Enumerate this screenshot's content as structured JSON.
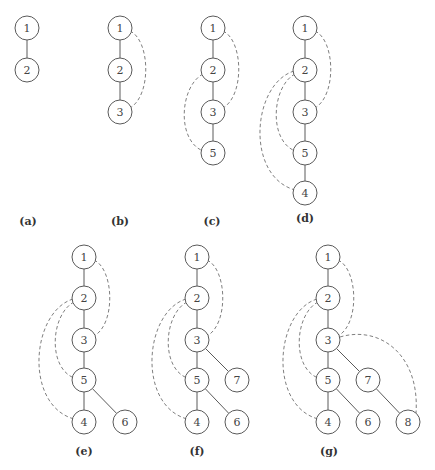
{
  "figure": {
    "style": {
      "node_stroke": "#5a5a5a",
      "edge_color": "#5a5a5a",
      "dashed_color": "#707070",
      "text_color": "#444444"
    },
    "panels": [
      {
        "caption": "(a)",
        "caption_pos": [
          28,
          225
        ],
        "nodes": [
          {
            "id": "1",
            "x": 27,
            "y": 28
          },
          {
            "id": "2",
            "x": 27,
            "y": 70
          }
        ],
        "tree_edges": [
          [
            "1",
            "2"
          ]
        ],
        "back_edges": []
      },
      {
        "caption": "(b)",
        "caption_pos": [
          120,
          225
        ],
        "nodes": [
          {
            "id": "1",
            "x": 120,
            "y": 28
          },
          {
            "id": "2",
            "x": 120,
            "y": 70
          },
          {
            "id": "3",
            "x": 120,
            "y": 112
          }
        ],
        "tree_edges": [
          [
            "1",
            "2"
          ],
          [
            "2",
            "3"
          ]
        ],
        "back_edges": [
          {
            "from": "1",
            "to": "3",
            "path": "M130,31 C150,40 152,95 130,108"
          }
        ]
      },
      {
        "caption": "(c)",
        "caption_pos": [
          212,
          225
        ],
        "nodes": [
          {
            "id": "1",
            "x": 213,
            "y": 28
          },
          {
            "id": "2",
            "x": 213,
            "y": 70
          },
          {
            "id": "3",
            "x": 213,
            "y": 112
          },
          {
            "id": "5",
            "x": 213,
            "y": 153
          }
        ],
        "tree_edges": [
          [
            "1",
            "2"
          ],
          [
            "2",
            "3"
          ],
          [
            "3",
            "5"
          ]
        ],
        "back_edges": [
          {
            "from": "1",
            "to": "3",
            "path": "M223,31 C243,40 245,95 223,108"
          },
          {
            "from": "2",
            "to": "5",
            "path": "M203,74 C180,86 176,140 203,151"
          }
        ]
      },
      {
        "caption": "(d)",
        "caption_pos": [
          305,
          222
        ],
        "nodes": [
          {
            "id": "1",
            "x": 305,
            "y": 28
          },
          {
            "id": "2",
            "x": 305,
            "y": 70
          },
          {
            "id": "3",
            "x": 305,
            "y": 112
          },
          {
            "id": "5",
            "x": 305,
            "y": 153
          },
          {
            "id": "4",
            "x": 305,
            "y": 193
          }
        ],
        "tree_edges": [
          [
            "1",
            "2"
          ],
          [
            "2",
            "3"
          ],
          [
            "3",
            "5"
          ],
          [
            "5",
            "4"
          ]
        ],
        "back_edges": [
          {
            "from": "1",
            "to": "3",
            "path": "M315,31 C335,40 337,95 315,108"
          },
          {
            "from": "2",
            "to": "5",
            "path": "M295,74 C272,86 268,140 295,151"
          },
          {
            "from": "2",
            "to": "4",
            "path": "M294,71 C252,84 245,176 295,190"
          }
        ]
      },
      {
        "caption": "(e)",
        "caption_pos": [
          84,
          455
        ],
        "nodes": [
          {
            "id": "1",
            "x": 84,
            "y": 257
          },
          {
            "id": "2",
            "x": 84,
            "y": 298
          },
          {
            "id": "3",
            "x": 84,
            "y": 340
          },
          {
            "id": "5",
            "x": 84,
            "y": 380
          },
          {
            "id": "4",
            "x": 84,
            "y": 422
          },
          {
            "id": "6",
            "x": 125,
            "y": 422
          }
        ],
        "tree_edges": [
          [
            "1",
            "2"
          ],
          [
            "2",
            "3"
          ],
          [
            "3",
            "5"
          ],
          [
            "5",
            "4"
          ],
          [
            "5",
            "6"
          ]
        ],
        "back_edges": [
          {
            "from": "1",
            "to": "3",
            "path": "M94,260 C114,269 116,324 94,336"
          },
          {
            "from": "2",
            "to": "5",
            "path": "M74,302 C51,314 47,367 74,378"
          },
          {
            "from": "2",
            "to": "4",
            "path": "M73,299 C31,312 24,405 74,419"
          }
        ]
      },
      {
        "caption": "(f)",
        "caption_pos": [
          197,
          455
        ],
        "nodes": [
          {
            "id": "1",
            "x": 197,
            "y": 257
          },
          {
            "id": "2",
            "x": 197,
            "y": 298
          },
          {
            "id": "3",
            "x": 197,
            "y": 340
          },
          {
            "id": "5",
            "x": 197,
            "y": 380
          },
          {
            "id": "7",
            "x": 237,
            "y": 380
          },
          {
            "id": "4",
            "x": 197,
            "y": 422
          },
          {
            "id": "6",
            "x": 237,
            "y": 422
          }
        ],
        "tree_edges": [
          [
            "1",
            "2"
          ],
          [
            "2",
            "3"
          ],
          [
            "3",
            "5"
          ],
          [
            "3",
            "7"
          ],
          [
            "5",
            "4"
          ],
          [
            "5",
            "6"
          ]
        ],
        "back_edges": [
          {
            "from": "1",
            "to": "3",
            "path": "M207,260 C227,269 229,324 207,336"
          },
          {
            "from": "2",
            "to": "5",
            "path": "M187,302 C164,314 160,367 187,378"
          },
          {
            "from": "2",
            "to": "4",
            "path": "M186,299 C144,312 137,405 187,419"
          }
        ]
      },
      {
        "caption": "(g)",
        "caption_pos": [
          329,
          455
        ],
        "nodes": [
          {
            "id": "1",
            "x": 328,
            "y": 257
          },
          {
            "id": "2",
            "x": 328,
            "y": 298
          },
          {
            "id": "3",
            "x": 328,
            "y": 340
          },
          {
            "id": "5",
            "x": 328,
            "y": 380
          },
          {
            "id": "7",
            "x": 368,
            "y": 380
          },
          {
            "id": "4",
            "x": 328,
            "y": 422
          },
          {
            "id": "6",
            "x": 368,
            "y": 422
          },
          {
            "id": "8",
            "x": 408,
            "y": 422
          }
        ],
        "tree_edges": [
          [
            "1",
            "2"
          ],
          [
            "2",
            "3"
          ],
          [
            "3",
            "5"
          ],
          [
            "3",
            "7"
          ],
          [
            "5",
            "4"
          ],
          [
            "5",
            "6"
          ],
          [
            "7",
            "8"
          ]
        ],
        "back_edges": [
          {
            "from": "1",
            "to": "3",
            "path": "M338,260 C358,269 360,324 338,336"
          },
          {
            "from": "2",
            "to": "5",
            "path": "M318,302 C295,314 291,367 318,378"
          },
          {
            "from": "2",
            "to": "4",
            "path": "M317,299 C275,312 268,405 318,419"
          },
          {
            "from": "3",
            "to": "8",
            "path": "M340,337 C380,325 420,355 416,413"
          }
        ]
      }
    ]
  }
}
